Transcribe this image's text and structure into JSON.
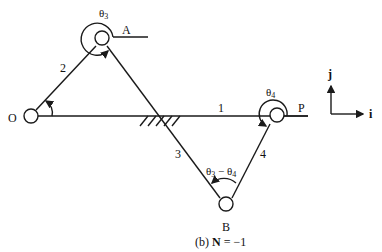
{
  "diagram": {
    "caption": "(b) N = −1",
    "caption_prefix": "(b)",
    "caption_bold": "N",
    "caption_suffix": " = −1",
    "nodes": [
      {
        "id": "O",
        "label": "O"
      },
      {
        "id": "A",
        "label": "A"
      },
      {
        "id": "B",
        "label": "B"
      },
      {
        "id": "P",
        "label": "P"
      }
    ],
    "links": [
      {
        "id": "1",
        "label": "1"
      },
      {
        "id": "2",
        "label": "2"
      },
      {
        "id": "3",
        "label": "3"
      },
      {
        "id": "4",
        "label": "4"
      }
    ],
    "angles": {
      "theta3": "θ3",
      "theta3_base": "θ",
      "theta3_sub": "3",
      "theta4_base": "θ",
      "theta4_sub": "4",
      "diff_a_base": "θ",
      "diff_a_sub": "3",
      "diff_minus": " − ",
      "diff_b_base": "θ",
      "diff_b_sub": "4"
    },
    "axes": {
      "j_label": "j",
      "i_label": "i"
    }
  }
}
